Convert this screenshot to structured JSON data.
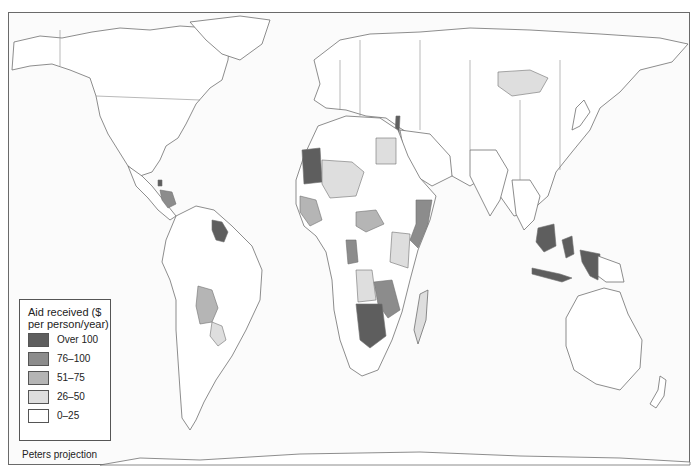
{
  "map": {
    "title": "Aid received by country",
    "projection_label": "Peters projection",
    "legend": {
      "title_line1": "Aid received ($",
      "title_line2": "per person/year)",
      "items": [
        {
          "label": "Over 100",
          "color": "#5e5e5e"
        },
        {
          "label": "76–100",
          "color": "#8c8c8c"
        },
        {
          "label": "51–75",
          "color": "#b5b5b5"
        },
        {
          "label": "26–50",
          "color": "#dedede"
        },
        {
          "label": "0–25",
          "color": "#ffffff"
        }
      ]
    },
    "colors": {
      "over_100": "#5e5e5e",
      "c76_100": "#8c8c8c",
      "c51_75": "#b5b5b5",
      "c26_50": "#dedede",
      "c0_25": "#ffffff",
      "border": "#707070",
      "frame": "#6a6a6a"
    },
    "highlighted_regions": [
      {
        "region": "Mauritania",
        "class": "Over 100"
      },
      {
        "region": "Guyana / Suriname",
        "class": "Over 100"
      },
      {
        "region": "Namibia / Botswana",
        "class": "Over 100"
      },
      {
        "region": "Indonesia / Papua New Guinea",
        "class": "Over 100"
      },
      {
        "region": "Israel",
        "class": "Over 100"
      },
      {
        "region": "Somalia",
        "class": "76–100"
      },
      {
        "region": "Zambia / Zimbabwe / Mozambique",
        "class": "76–100"
      },
      {
        "region": "Honduras / Nicaragua",
        "class": "76–100"
      },
      {
        "region": "Bolivia",
        "class": "51–75"
      },
      {
        "region": "Central African Republic",
        "class": "51–75"
      },
      {
        "region": "West Africa coast",
        "class": "51–75"
      },
      {
        "region": "Mongolia",
        "class": "26–50"
      },
      {
        "region": "Egypt",
        "class": "26–50"
      },
      {
        "region": "Mali / Niger / Chad",
        "class": "26–50"
      },
      {
        "region": "Angola",
        "class": "26–50"
      },
      {
        "region": "Tanzania / Kenya",
        "class": "26–50"
      },
      {
        "region": "Madagascar",
        "class": "26–50"
      },
      {
        "region": "Paraguay",
        "class": "26–50"
      }
    ]
  }
}
